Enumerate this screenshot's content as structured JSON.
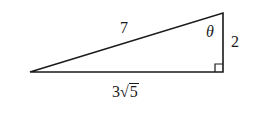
{
  "figure": {
    "type": "right-triangle",
    "labels": {
      "hypotenuse": "7",
      "vertical_side": "2",
      "base_coefficient": "3",
      "base_radical_symbol": "√",
      "base_radicand": "5",
      "angle": "θ"
    },
    "right_angle_at": "bottom-right",
    "angle_at": "top-right",
    "stroke_color": "#1a1a1a"
  }
}
